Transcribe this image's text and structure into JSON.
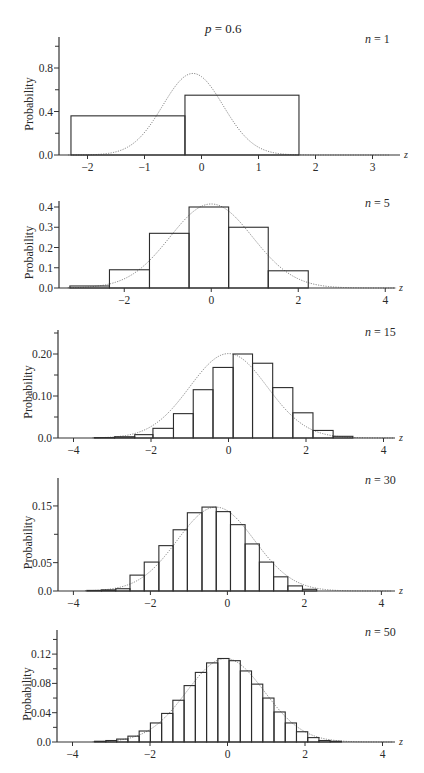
{
  "figure": {
    "title_param": "p",
    "title_value": "0.6",
    "title_text": "p = 0.6",
    "ylabel": "Probability",
    "xlabel": "z"
  },
  "chart_data": [
    {
      "type": "bar",
      "title": "n = 1",
      "n": 1,
      "p": 0.6,
      "xlabel": "z",
      "ylabel": "Probability",
      "xlim": [
        -2.5,
        3.45
      ],
      "ylim": [
        0,
        1.1
      ],
      "xticks": [
        -2,
        -1,
        0,
        1,
        2,
        3
      ],
      "xtick_labels": [
        "−2",
        "−1",
        "0",
        "1",
        "2",
        "3"
      ],
      "yticks_major": [
        0.0,
        0.4,
        0.8
      ],
      "ytick_labels": [
        "0.0",
        "0.4",
        "0.8"
      ],
      "yticks_minor": [
        0.2,
        0.6,
        1.0
      ],
      "bins": [
        {
          "left": -2.29,
          "right": -0.29,
          "value": 0.36
        },
        {
          "left": -0.29,
          "right": 1.71,
          "value": 0.55
        }
      ],
      "normal_curve": {
        "mean": -0.15,
        "sd": 0.53,
        "peak": 0.75
      },
      "grid": false,
      "panel_px": {
        "x0": 59,
        "y0": 155,
        "xscale": 57,
        "yscale": 108.75,
        "ytop": 37,
        "xend": 400
      }
    },
    {
      "type": "bar",
      "title": "n = 5",
      "n": 5,
      "p": 0.6,
      "xlabel": "z",
      "ylabel": "Probability",
      "xlim": [
        -3.5,
        4.4
      ],
      "ylim": [
        0,
        0.43
      ],
      "xticks": [
        -2,
        0,
        2,
        4
      ],
      "xtick_labels": [
        "−2",
        "0",
        "2",
        "4"
      ],
      "yticks_major": [
        0.0,
        0.1,
        0.2,
        0.3,
        0.4
      ],
      "ytick_labels": [
        "0.0",
        "0.1",
        "0.2",
        "0.3",
        "0.4"
      ],
      "yticks_minor": [],
      "bins": [
        {
          "left": -3.25,
          "right": -2.34,
          "value": 0.01
        },
        {
          "left": -2.34,
          "right": -1.42,
          "value": 0.09
        },
        {
          "left": -1.42,
          "right": -0.51,
          "value": 0.27
        },
        {
          "left": -0.51,
          "right": 0.4,
          "value": 0.4
        },
        {
          "left": 0.4,
          "right": 1.31,
          "value": 0.3
        },
        {
          "left": 1.31,
          "right": 2.23,
          "value": 0.085
        }
      ],
      "normal_curve": {
        "mean": 0.0,
        "sd": 0.95,
        "peak": 0.415
      },
      "grid": false,
      "panel_px": {
        "x0": 59,
        "y0": 288,
        "xscale": 43.5,
        "yscale": 202.5,
        "ytop": 201,
        "xend": 395
      }
    },
    {
      "type": "bar",
      "title": "n = 15",
      "n": 15,
      "p": 0.6,
      "xlabel": "z",
      "ylabel": "Probability",
      "xlim": [
        -4.4,
        4.4
      ],
      "ylim": [
        0,
        0.26
      ],
      "xticks": [
        -4,
        -2,
        0,
        2,
        4
      ],
      "xtick_labels": [
        "−4",
        "−2",
        "0",
        "2",
        "4"
      ],
      "yticks_major": [
        0.0,
        0.1,
        0.2
      ],
      "ytick_labels": [
        "0.0",
        "0.10",
        "0.20"
      ],
      "yticks_minor": [
        0.05,
        0.15,
        0.25
      ],
      "bins": [
        {
          "left": -3.46,
          "right": -2.94,
          "value": 0.001
        },
        {
          "left": -2.94,
          "right": -2.42,
          "value": 0.003
        },
        {
          "left": -2.42,
          "right": -1.95,
          "value": 0.008
        },
        {
          "left": -1.95,
          "right": -1.42,
          "value": 0.023
        },
        {
          "left": -1.42,
          "right": -0.91,
          "value": 0.058
        },
        {
          "left": -0.91,
          "right": -0.4,
          "value": 0.115
        },
        {
          "left": -0.4,
          "right": 0.12,
          "value": 0.168
        },
        {
          "left": 0.12,
          "right": 0.62,
          "value": 0.2
        },
        {
          "left": 0.62,
          "right": 1.14,
          "value": 0.178
        },
        {
          "left": 1.14,
          "right": 1.66,
          "value": 0.12
        },
        {
          "left": 1.66,
          "right": 2.18,
          "value": 0.06
        },
        {
          "left": 2.18,
          "right": 2.7,
          "value": 0.018
        },
        {
          "left": 2.7,
          "right": 3.21,
          "value": 0.004
        }
      ],
      "normal_curve": {
        "mean": 0.0,
        "sd": 1.0,
        "peak": 0.201
      },
      "grid": false,
      "panel_px": {
        "x0": 58,
        "y0": 438,
        "xscale": 38.75,
        "yscale": 420,
        "ytop": 330,
        "xend": 395
      }
    },
    {
      "type": "bar",
      "title": "n = 30",
      "n": 30,
      "p": 0.6,
      "xlabel": "z",
      "ylabel": "Probability",
      "xlim": [
        -4.4,
        4.4
      ],
      "ylim": [
        0,
        0.2
      ],
      "xticks": [
        -4,
        -2,
        0,
        2,
        4
      ],
      "xtick_labels": [
        "−4",
        "−2",
        "0",
        "2",
        "4"
      ],
      "yticks_major": [
        0.0,
        0.05,
        0.15
      ],
      "ytick_labels": [
        "0.0",
        "0.05",
        "0.15"
      ],
      "yticks_minor": [
        0.1
      ],
      "bins": [
        {
          "left": -3.65,
          "right": -3.27,
          "value": 0.001
        },
        {
          "left": -3.27,
          "right": -2.9,
          "value": 0.002
        },
        {
          "left": -2.9,
          "right": -2.53,
          "value": 0.004
        },
        {
          "left": -2.53,
          "right": -2.16,
          "value": 0.028
        },
        {
          "left": -2.16,
          "right": -1.78,
          "value": 0.051
        },
        {
          "left": -1.78,
          "right": -1.41,
          "value": 0.08
        },
        {
          "left": -1.41,
          "right": -1.04,
          "value": 0.108
        },
        {
          "left": -1.04,
          "right": -0.66,
          "value": 0.138
        },
        {
          "left": -0.66,
          "right": -0.29,
          "value": 0.148
        },
        {
          "left": -0.29,
          "right": 0.08,
          "value": 0.14
        },
        {
          "left": 0.08,
          "right": 0.46,
          "value": 0.117
        },
        {
          "left": 0.46,
          "right": 0.83,
          "value": 0.083
        },
        {
          "left": 0.83,
          "right": 1.2,
          "value": 0.051
        },
        {
          "left": 1.2,
          "right": 1.57,
          "value": 0.025
        },
        {
          "left": 1.57,
          "right": 1.95,
          "value": 0.009
        },
        {
          "left": 1.95,
          "right": 2.32,
          "value": 0.003
        }
      ],
      "normal_curve": {
        "mean": -0.3,
        "sd": 1.0,
        "peak": 0.148
      },
      "grid": false,
      "panel_px": {
        "x0": 58,
        "y0": 591,
        "xscale": 38.5,
        "yscale": 567,
        "ytop": 478,
        "xend": 395
      }
    },
    {
      "type": "bar",
      "title": "n = 50",
      "n": 50,
      "p": 0.6,
      "xlabel": "z",
      "ylabel": "Probability",
      "xlim": [
        -4.4,
        4.4
      ],
      "ylim": [
        0,
        0.148
      ],
      "xticks": [
        -4,
        -2,
        0,
        2,
        4
      ],
      "xtick_labels": [
        "−4",
        "−2",
        "0",
        "2",
        "4"
      ],
      "yticks_major": [
        0.0,
        0.04,
        0.08,
        0.12
      ],
      "ytick_labels": [
        "0.0",
        "0.04",
        "0.08",
        "0.12"
      ],
      "yticks_minor": [
        0.02,
        0.06,
        0.1,
        0.14
      ],
      "bins": [
        {
          "left": -3.43,
          "right": -3.14,
          "value": 0.001
        },
        {
          "left": -3.14,
          "right": -2.86,
          "value": 0.002
        },
        {
          "left": -2.86,
          "right": -2.57,
          "value": 0.004
        },
        {
          "left": -2.57,
          "right": -2.28,
          "value": 0.008
        },
        {
          "left": -2.28,
          "right": -1.99,
          "value": 0.015
        },
        {
          "left": -1.99,
          "right": -1.7,
          "value": 0.026
        },
        {
          "left": -1.7,
          "right": -1.41,
          "value": 0.039
        },
        {
          "left": -1.41,
          "right": -1.12,
          "value": 0.057
        },
        {
          "left": -1.12,
          "right": -0.83,
          "value": 0.077
        },
        {
          "left": -0.83,
          "right": -0.54,
          "value": 0.095
        },
        {
          "left": -0.54,
          "right": -0.25,
          "value": 0.108
        },
        {
          "left": -0.25,
          "right": 0.04,
          "value": 0.114
        },
        {
          "left": 0.04,
          "right": 0.33,
          "value": 0.111
        },
        {
          "left": 0.33,
          "right": 0.62,
          "value": 0.097
        },
        {
          "left": 0.62,
          "right": 0.91,
          "value": 0.079
        },
        {
          "left": 0.91,
          "right": 1.2,
          "value": 0.06
        },
        {
          "left": 1.2,
          "right": 1.49,
          "value": 0.041
        },
        {
          "left": 1.49,
          "right": 1.78,
          "value": 0.026
        },
        {
          "left": 1.78,
          "right": 2.07,
          "value": 0.014
        },
        {
          "left": 2.07,
          "right": 2.36,
          "value": 0.006
        },
        {
          "left": 2.36,
          "right": 2.65,
          "value": 0.002
        },
        {
          "left": 2.65,
          "right": 2.94,
          "value": 0.001
        }
      ],
      "normal_curve": {
        "mean": -0.05,
        "sd": 1.0,
        "peak": 0.114
      },
      "grid": false,
      "panel_px": {
        "x0": 57,
        "y0": 742,
        "xscale": 38.75,
        "yscale": 732.5,
        "ytop": 630,
        "xend": 395
      }
    }
  ]
}
